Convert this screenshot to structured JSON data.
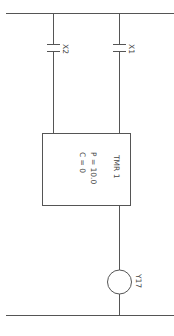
{
  "diagram": {
    "type": "ladder-logic",
    "orientation": "rotated-90-cw",
    "colors": {
      "line": "#555555",
      "text": "#444444",
      "background": "#ffffff"
    },
    "rails": {
      "top_rail": {
        "y": 13
      },
      "bottom_rail": {
        "y": 315
      }
    },
    "contacts": [
      {
        "id": "contact-x2",
        "label": "X2",
        "type": "normally-open"
      },
      {
        "id": "contact-x1",
        "label": "X1",
        "type": "normally-open"
      }
    ],
    "timer": {
      "name": "TMR 1",
      "preset": "P = 10.0",
      "current": "C = 0"
    },
    "coil": {
      "label": "Y17"
    }
  }
}
